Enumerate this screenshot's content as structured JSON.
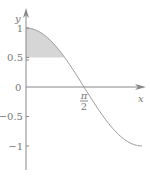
{
  "chart_data": {
    "type": "line",
    "function": "cos(x)",
    "x_domain": [
      0,
      3.14159
    ],
    "shaded_region": {
      "x_from": 0,
      "y_from": 0.5,
      "y_to": "cos(x)",
      "fill": "#d6d6d6"
    },
    "xlabel": "x",
    "ylabel": "y",
    "origin_label": "0",
    "y_ticks": [
      {
        "value": 1,
        "label": "1"
      },
      {
        "value": 0.5,
        "label": "0.5"
      },
      {
        "value": -0.5,
        "label": "-0.5"
      },
      {
        "value": -1,
        "label": "-1"
      }
    ],
    "x_ticks": [
      {
        "value": 1.5708,
        "label_num": "π",
        "label_den": "2"
      }
    ],
    "colors": {
      "axis": "#888888",
      "curve": "#999999",
      "shade": "#d6d6d6"
    }
  }
}
